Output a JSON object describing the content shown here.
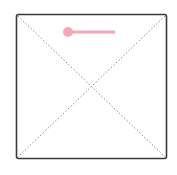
{
  "placeholder": {
    "icon": "image-placeholder-icon",
    "border_color": "#3a3a3a",
    "diagonal_color": "#8a8a8a",
    "box": {
      "x": 16,
      "y": 14,
      "width": 151,
      "height": 145
    }
  },
  "slider": {
    "icon": "slider-handle-icon",
    "color": "#f4a7b4",
    "handle": {
      "cx": 68,
      "cy": 32,
      "r": 5
    },
    "track": {
      "x1": 68,
      "y1": 32,
      "x2": 114,
      "y2": 32
    }
  }
}
